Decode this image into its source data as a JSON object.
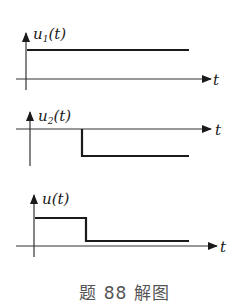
{
  "caption": "题 88 解图",
  "colors": {
    "line": "#1a1a1a",
    "axis": "#333333",
    "caption": "#555555"
  },
  "panels": [
    {
      "name": "u1",
      "ylabel_main": "u",
      "ylabel_sub": "1",
      "ylabel_arg": "(t)",
      "xlabel": "t",
      "description": "constant positive level for t >= 0"
    },
    {
      "name": "u2",
      "ylabel_main": "u",
      "ylabel_sub": "2",
      "ylabel_arg": "(t)",
      "xlabel": "t",
      "description": "zero until t0, then constant negative level"
    },
    {
      "name": "u",
      "ylabel_main": "u",
      "ylabel_sub": "",
      "ylabel_arg": "(t)",
      "xlabel": "t",
      "description": "sum: positive level until t0, then small positive level"
    }
  ]
}
